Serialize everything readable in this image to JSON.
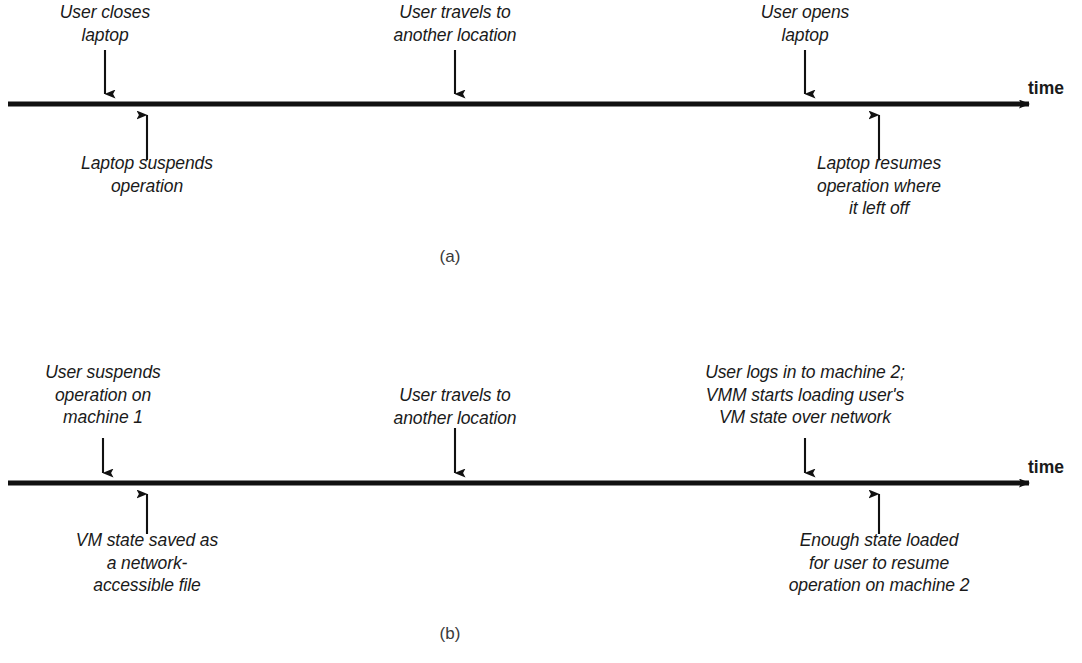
{
  "figure": {
    "type": "timeline-diagram",
    "background_color": "#ffffff",
    "line_color": "#111111",
    "text_color": "#1a1a1a"
  },
  "panels": [
    {
      "id": "a",
      "caption": "(a)",
      "axis_label": "time",
      "labels_above": [
        {
          "text": "User closes\nlaptop"
        },
        {
          "text": "User travels to\nanother location"
        },
        {
          "text": "User opens\nlaptop"
        }
      ],
      "labels_below": [
        {
          "text": "Laptop suspends\noperation"
        },
        {
          "text": "Laptop resumes\noperation where\nit left off"
        }
      ]
    },
    {
      "id": "b",
      "caption": "(b)",
      "axis_label": "time",
      "labels_above": [
        {
          "text": "User suspends\noperation on\nmachine 1"
        },
        {
          "text": "User travels to\nanother location"
        },
        {
          "text": "User logs in to machine 2;\nVMM starts loading user's\nVM state over network"
        }
      ],
      "labels_below": [
        {
          "text": "VM state saved as\na network-\naccessible file"
        },
        {
          "text": "Enough state loaded\nfor user to resume\noperation on machine 2"
        }
      ]
    }
  ]
}
